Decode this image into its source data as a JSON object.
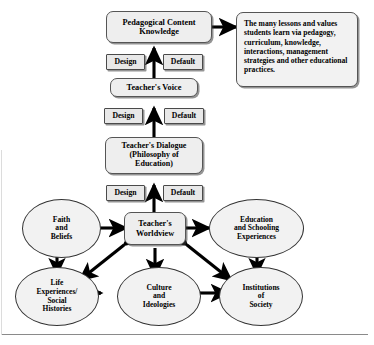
{
  "diagram": {
    "chain": {
      "pedagogical_content_knowledge": "Pedagogical Content\nKnowledge",
      "teachers_voice": "Teacher's Voice",
      "teachers_dialogue": "Teacher's Dialogue\n(Philosophy of\nEducation)",
      "teachers_worldview": "Teacher's\nWorldview"
    },
    "filters": {
      "design": "Design",
      "default": "Default",
      "pairs": [
        {
          "design": "Design",
          "default": "Default"
        },
        {
          "design": "Design",
          "default": "Default"
        },
        {
          "design": "Design",
          "default": "Default"
        }
      ]
    },
    "outcome_box": "The many lessons and values students learn via pedagogy, curriculum, knowledge, interactions, management strategies and other educational practices.",
    "influences": [
      {
        "id": "faith-and-beliefs",
        "label": "Faith\nand\nBeliefs"
      },
      {
        "id": "education-and-schooling-experiences",
        "label": "Education\nand Schooling\nExperiences"
      },
      {
        "id": "life-experiences-social-histories",
        "label": "Life\nExperiences/\nSocial\nHistories"
      },
      {
        "id": "culture-and-ideologies",
        "label": "Culture\nand\nIdeologies"
      },
      {
        "id": "institutions-of-society",
        "label": "Institutions\nof\nSociety"
      }
    ],
    "colors": {
      "box_fill": "#eeeeee",
      "ellipse_fill": "#f2f2f2",
      "outline": "#333333",
      "arrow": "#000000",
      "shadow": "#3c3c3c"
    }
  }
}
